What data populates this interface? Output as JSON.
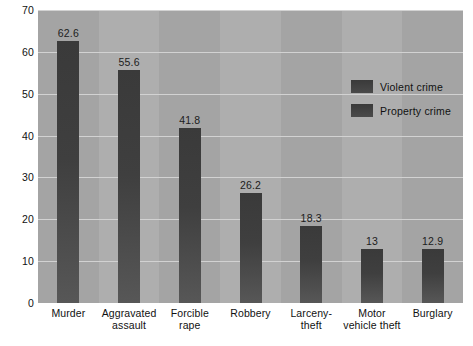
{
  "chart_data": {
    "type": "bar",
    "title": "",
    "subtitle": "",
    "xlabel": "",
    "ylabel": "",
    "ylim": [
      0,
      70
    ],
    "ytick_step": 10,
    "yticks": [
      "70",
      "60",
      "50",
      "40",
      "30",
      "20",
      "10",
      "0"
    ],
    "grid": true,
    "legend_position": "upper-right",
    "categories": [
      "Murder",
      "Aggravated assault",
      "Forcible rape",
      "Robbery",
      "Larceny-theft",
      "Motor vehicle theft",
      "Burglary"
    ],
    "category_lines": [
      [
        "Murder"
      ],
      [
        "Aggravated",
        "assault"
      ],
      [
        "Forcible",
        "rape"
      ],
      [
        "Robbery"
      ],
      [
        "Larceny-",
        "theft"
      ],
      [
        "Motor",
        "vehicle theft"
      ],
      [
        "Burglary"
      ]
    ],
    "values": [
      62.6,
      55.6,
      41.8,
      26.2,
      18.3,
      13,
      12.9
    ],
    "value_labels": [
      "62.6",
      "55.6",
      "41.8",
      "26.2",
      "18.3",
      "13",
      "12.9"
    ],
    "legend": [
      {
        "label": "Violent crime",
        "color": "#3f3f3f"
      },
      {
        "label": "Property crime",
        "color": "#3f3f3f"
      }
    ],
    "colors": {
      "plot_background": "#a9a9a9",
      "bar": "#3f3f3f",
      "gridline": "#d2d2d2",
      "text": "#111111",
      "page_background": "#ffffff"
    }
  }
}
